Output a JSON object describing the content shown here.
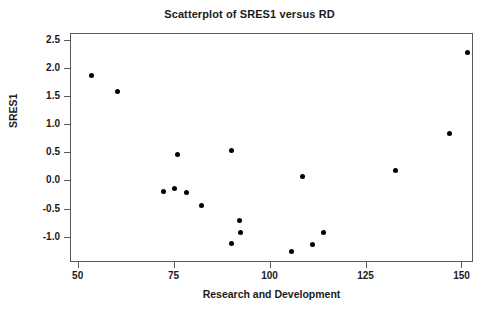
{
  "chart_data": {
    "type": "scatter",
    "title": "Scatterplot of SRES1 versus RD",
    "xlabel": "Research and Development",
    "ylabel": "SRES1",
    "xlim": [
      48,
      153
    ],
    "ylim": [
      -1.45,
      2.62
    ],
    "grid": false,
    "legend": null,
    "xticks": [
      50,
      75,
      100,
      125,
      150
    ],
    "xtick_labels": [
      "50",
      "75",
      "100",
      "125",
      "150"
    ],
    "yticks": [
      2.5,
      2.0,
      1.5,
      1.0,
      0.5,
      0.0,
      -0.5,
      -1.0
    ],
    "ytick_labels": [
      "2.5",
      "2.0",
      "1.5",
      "1.0",
      "0.5",
      "0.0",
      "-0.5",
      "-1.0"
    ],
    "marker": "filled-circle",
    "marker_color": "#000000",
    "points": [
      {
        "x": 53.7,
        "y": 1.86
      },
      {
        "x": 60.5,
        "y": 1.58
      },
      {
        "x": 72.3,
        "y": -0.19
      },
      {
        "x": 75.1,
        "y": -0.15
      },
      {
        "x": 76.0,
        "y": 0.46
      },
      {
        "x": 78.3,
        "y": -0.22
      },
      {
        "x": 82.2,
        "y": -0.44
      },
      {
        "x": 90.0,
        "y": 0.53
      },
      {
        "x": 90.2,
        "y": -1.12
      },
      {
        "x": 92.1,
        "y": -0.72
      },
      {
        "x": 92.4,
        "y": -0.93
      },
      {
        "x": 105.7,
        "y": -1.26
      },
      {
        "x": 108.7,
        "y": 0.07
      },
      {
        "x": 111.3,
        "y": -1.14
      },
      {
        "x": 114.0,
        "y": -0.92
      },
      {
        "x": 132.8,
        "y": 0.17
      },
      {
        "x": 146.8,
        "y": 0.84
      },
      {
        "x": 151.5,
        "y": 2.28
      }
    ]
  },
  "axes": {
    "frame_color": "#55585c"
  }
}
